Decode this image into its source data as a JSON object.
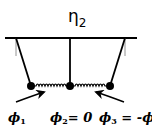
{
  "diagram": {
    "title_symbol": "η",
    "title_subscript": "2",
    "labels": [
      {
        "symbol": "ϕ",
        "subscript": "1",
        "suffix": ""
      },
      {
        "symbol": "ϕ",
        "subscript": "2",
        "suffix": "= 0"
      },
      {
        "symbol": "ϕ",
        "subscript": "3",
        "suffix": " = -ϕ",
        "suffix_sub": "1"
      }
    ],
    "components": {
      "support_bar": "horizontal rigid support",
      "pendulums": 3,
      "springs": 2,
      "arrows": 2
    },
    "colors": {
      "ink": "#000000",
      "background": "#ffffff"
    }
  }
}
